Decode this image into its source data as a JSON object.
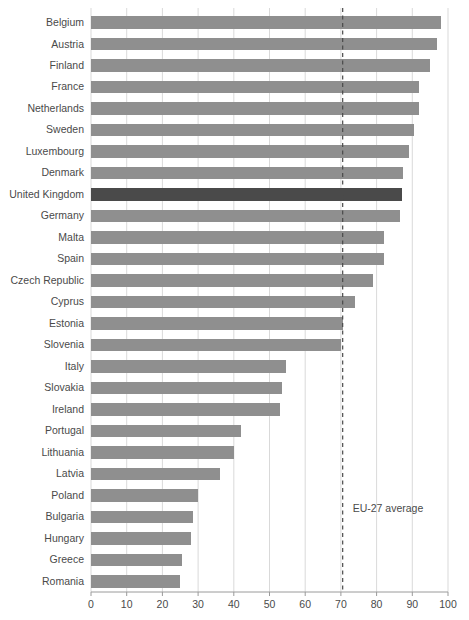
{
  "chart_data": {
    "type": "bar",
    "orientation": "horizontal",
    "title": "",
    "subtitle": "",
    "xlabel": "",
    "ylabel": "",
    "xlim": [
      0,
      100
    ],
    "ylim": null,
    "grid": true,
    "legend": false,
    "xticks": [
      0,
      10,
      20,
      30,
      40,
      50,
      60,
      70,
      80,
      90,
      100
    ],
    "categories": [
      "Belgium",
      "Austria",
      "Finland",
      "France",
      "Netherlands",
      "Sweden",
      "Luxembourg",
      "Denmark",
      "United Kingdom",
      "Germany",
      "Malta",
      "Spain",
      "Czech Republic",
      "Cyprus",
      "Estonia",
      "Slovenia",
      "Italy",
      "Slovakia",
      "Ireland",
      "Portugal",
      "Lithuania",
      "Latvia",
      "Poland",
      "Bulgaria",
      "Hungary",
      "Greece",
      "Romania"
    ],
    "values": [
      98,
      97,
      95,
      92,
      92,
      90.5,
      89,
      87.5,
      87,
      86.5,
      82,
      82,
      79,
      74,
      70.5,
      70,
      54.5,
      53.5,
      53,
      42,
      40,
      36,
      30,
      28.5,
      28,
      25.5,
      25
    ],
    "highlight_category": "United Kingdom",
    "annotations": [
      {
        "name": "eu27-average",
        "label": "EU-27 average",
        "value": 70.5,
        "style": "dashed-vertical-line"
      }
    ],
    "colors": {
      "bar": "#8f8f8f",
      "bar_highlight": "#4a4a4a",
      "gridline": "#cfcfcf",
      "axis": "#9a9a9a",
      "text": "#4a4a4a",
      "background": "#ffffff"
    }
  }
}
